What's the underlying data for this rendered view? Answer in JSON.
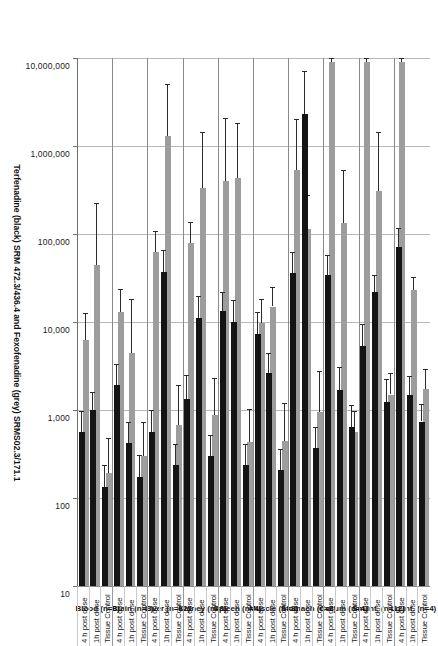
{
  "chart_data": {
    "type": "bar",
    "orientation": "horizontal",
    "title": "",
    "xlabel": "Terfenadine (black) SRM 472.3/436.4 and Fexofenadine (grey)  SRMS02.3/171.1",
    "ylabel": "",
    "xscale": "log",
    "xlim": [
      10,
      10000000
    ],
    "xticks": [
      10,
      100,
      1000,
      10000,
      100000,
      1000000,
      10000000
    ],
    "xtick_labels": [
      "10",
      "100",
      "1,000",
      "10,000",
      "100,000",
      "1,000,000",
      "10,000,000"
    ],
    "grid": true,
    "legend": "encoded-in-axis-title",
    "condition_labels": [
      "Tissue Control",
      "1h post dose",
      "4 h post dose"
    ],
    "series": [
      {
        "name": "Terfenadine (black) SRM 472.3/436.4",
        "color": "#141414"
      },
      {
        "name": "Fexofenadine (grey) SRMS02.3/171.1",
        "color": "#9d9d9d"
      }
    ],
    "groups": [
      {
        "name": "Lg Int.",
        "n": 4,
        "label": "Lg Int. (n=4)",
        "rows": [
          {
            "condition": "Tissue Control",
            "black": {
              "value": 740,
              "err_low": 430
            },
            "grey": {
              "value": 1750,
              "err_low": 1180
            }
          },
          {
            "condition": "1h post dose",
            "black": {
              "value": 1480,
              "err_low": 980
            },
            "grey": {
              "value": 23000,
              "err_low": 9800
            }
          },
          {
            "condition": "4 h post dose",
            "black": {
              "value": 72000,
              "err_low": 44000
            },
            "grey": {
              "value": 9000000,
              "err_low": 9000000
            }
          }
        ]
      },
      {
        "name": "Sm Int.",
        "n": 12,
        "label": "Sm Int. (n=12)",
        "rows": [
          {
            "condition": "Tissue Control",
            "black": {
              "value": 1220,
              "err_low": 1030
            },
            "grey": {
              "value": 1500,
              "err_low": 1150
            }
          },
          {
            "condition": "1h post dose",
            "black": {
              "value": 22000,
              "err_low": 12500
            },
            "grey": {
              "value": 310000,
              "err_low": 1150000
            }
          },
          {
            "condition": "4 h post dose",
            "black": {
              "value": 5400,
              "err_low": 4200
            },
            "grey": {
              "value": 9000000,
              "err_low": 9000000
            }
          }
        ]
      },
      {
        "name": "Cecum",
        "n": 4,
        "label": "Cecum (n=4)",
        "rows": [
          {
            "condition": "Tissue Control",
            "black": {
              "value": 640,
              "err_low": 490
            },
            "grey": {
              "value": 560,
              "err_low": 420
            }
          },
          {
            "condition": "1h post dose",
            "black": {
              "value": 1700,
              "err_low": 1350
            },
            "grey": {
              "value": 135000,
              "err_low": 400000
            }
          },
          {
            "condition": "4 h post dose",
            "black": {
              "value": 34000,
              "err_low": 24000
            },
            "grey": {
              "value": 9000000,
              "err_low": 9000000
            }
          }
        ]
      },
      {
        "name": "Stomach",
        "n": 8,
        "label": "Stomach (n=8)",
        "rows": [
          {
            "condition": "Tissue Control",
            "black": {
              "value": 370,
              "err_low": 270
            },
            "grey": {
              "value": 940,
              "err_low": 1800
            }
          },
          {
            "condition": "1h post dose",
            "black": {
              "value": 2300000,
              "err_low": 4900000
            },
            "grey": {
              "value": 115000,
              "err_low": 165000
            }
          },
          {
            "condition": "4 h post dose",
            "black": {
              "value": 36000,
              "err_low": 26000
            },
            "grey": {
              "value": 540000,
              "err_low": 1500000
            }
          }
        ]
      },
      {
        "name": "Muscle",
        "n": 8,
        "label": "Muscle (n=8)",
        "rows": [
          {
            "condition": "Tissue Control",
            "black": {
              "value": 210,
              "err_low": 155
            },
            "grey": {
              "value": 450,
              "err_low": 740
            }
          },
          {
            "condition": "1h post dose",
            "black": {
              "value": 2600,
              "err_low": 1900
            },
            "grey": {
              "value": 15000,
              "err_low": 9800
            }
          },
          {
            "condition": "4 h post dose",
            "black": {
              "value": 7300,
              "err_low": 5600
            },
            "grey": {
              "value": 9800,
              "err_low": 8600
            }
          }
        ]
      },
      {
        "name": "Spleen",
        "n": 4,
        "label": "Spleen (n=4)",
        "rows": [
          {
            "condition": "Tissue Control",
            "black": {
              "value": 235,
              "err_low": 175
            },
            "grey": {
              "value": 430,
              "err_low": 610
            }
          },
          {
            "condition": "1h post dose",
            "black": {
              "value": 10000,
              "err_low": 7800
            },
            "grey": {
              "value": 430000,
              "err_low": 1400000
            }
          },
          {
            "condition": "4 h post dose",
            "black": {
              "value": 13500,
              "err_low": 8300
            },
            "grey": {
              "value": 400000,
              "err_low": 1700000
            }
          }
        ]
      },
      {
        "name": "Kidney",
        "n": 8,
        "label": "Kidney (n=8)",
        "rows": [
          {
            "condition": "Tissue Control",
            "black": {
              "value": 300,
              "err_low": 225
            },
            "grey": {
              "value": 880,
              "err_low": 1450
            }
          },
          {
            "condition": "1h post dose",
            "black": {
              "value": 11000,
              "err_low": 8600
            },
            "grey": {
              "value": 330000,
              "err_low": 1100000
            }
          },
          {
            "condition": "4 h post dose",
            "black": {
              "value": 1350,
              "err_low": 1150
            },
            "grey": {
              "value": 80000,
              "err_low": 57000
            }
          }
        ]
      },
      {
        "name": "Liver",
        "n": 12,
        "label": "Liver (n=12)",
        "rows": [
          {
            "condition": "Tissue Control",
            "black": {
              "value": 240,
              "err_low": 175
            },
            "grey": {
              "value": 680,
              "err_low": 1250
            }
          },
          {
            "condition": "1h post dose",
            "black": {
              "value": 37000,
              "err_low": 29000
            },
            "grey": {
              "value": 1300000,
              "err_low": 3800000
            }
          },
          {
            "condition": "4 h post dose",
            "black": {
              "value": 560,
              "err_low": 440
            },
            "grey": {
              "value": 62000,
              "err_low": 46000
            }
          }
        ]
      },
      {
        "name": "Brain",
        "n": 8,
        "label": "Brain (n=8)",
        "rows": [
          {
            "condition": "Tissue Control",
            "black": {
              "value": 175,
              "err_low": 130
            },
            "grey": {
              "value": 300,
              "err_low": 440
            }
          },
          {
            "condition": "1h post dose",
            "black": {
              "value": 420,
              "err_low": 310
            },
            "grey": {
              "value": 4400,
              "err_low": 14000
            }
          },
          {
            "condition": "4 h post dose",
            "black": {
              "value": 1900,
              "err_low": 1400
            },
            "grey": {
              "value": 13000,
              "err_low": 11000
            }
          }
        ]
      },
      {
        "name": "Blood",
        "n": 8,
        "label": "Blood (n=8)",
        "rows": [
          {
            "condition": "Tissue Control",
            "black": {
              "value": 135,
              "err_low": 100
            },
            "grey": {
              "value": 190,
              "err_low": 290
            }
          },
          {
            "condition": "1h post dose",
            "black": {
              "value": 1000,
              "err_low": 620
            },
            "grey": {
              "value": 44000,
              "err_low": 180000
            }
          },
          {
            "condition": "4 h post dose",
            "black": {
              "value": 560,
              "err_low": 410
            },
            "grey": {
              "value": 6200,
              "err_low": 6400
            }
          }
        ]
      }
    ]
  }
}
